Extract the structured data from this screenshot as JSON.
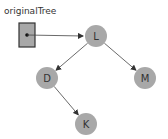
{
  "pointer": {
    "label": "originalTree",
    "target": "L"
  },
  "colors": {
    "node_fill": "#a8a8a8",
    "box_fill": "#a8a8a8",
    "line": "#444444"
  },
  "nodes": [
    {
      "id": "L",
      "label": "L"
    },
    {
      "id": "D",
      "label": "D"
    },
    {
      "id": "M",
      "label": "M"
    },
    {
      "id": "K",
      "label": "K"
    }
  ],
  "edges": [
    {
      "from": "L",
      "to": "D"
    },
    {
      "from": "L",
      "to": "M"
    },
    {
      "from": "D",
      "to": "K"
    }
  ]
}
